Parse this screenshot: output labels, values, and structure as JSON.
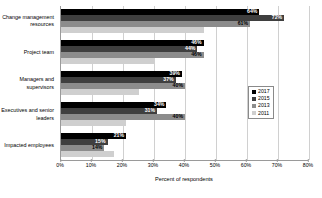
{
  "chart_data": {
    "type": "bar",
    "orientation": "horizontal",
    "title": "",
    "xlabel": "Percent of respondents",
    "ylabel": "",
    "xlim": [
      0,
      80
    ],
    "xticks": [
      "0%",
      "10%",
      "20%",
      "30%",
      "40%",
      "50%",
      "60%",
      "70%",
      "80%"
    ],
    "grid": true,
    "legend_position": "right",
    "categories": [
      "Change management resources",
      "Project team",
      "Managers and supervisors",
      "Executives and senior leaders",
      "Impacted employees"
    ],
    "series": [
      {
        "name": "2017",
        "color": "#000000",
        "values": [
          64,
          46,
          39,
          34,
          21
        ],
        "labels": [
          "64%",
          "46%",
          "39%",
          "34%",
          "21%"
        ]
      },
      {
        "name": "2015",
        "color": "#3f3f3f",
        "values": [
          72,
          44,
          37,
          31,
          15
        ],
        "labels": [
          "72%",
          "44%",
          "37%",
          "31%",
          "15%"
        ]
      },
      {
        "name": "2013",
        "color": "#8c8c8c",
        "values": [
          61,
          46,
          40,
          40,
          14
        ],
        "labels": [
          "61%",
          "46%",
          "40%",
          "40%",
          "14%"
        ]
      },
      {
        "name": "2011",
        "color": "#cfcfcf",
        "values": [
          46,
          30,
          25,
          21,
          17
        ],
        "labels": [
          "",
          "",
          "",
          "",
          ""
        ]
      }
    ]
  },
  "legend": {
    "items": [
      {
        "label": "2017",
        "color": "#000000"
      },
      {
        "label": "2015",
        "color": "#3f3f3f"
      },
      {
        "label": "2013",
        "color": "#8c8c8c"
      },
      {
        "label": "2011",
        "color": "#cfcfcf"
      }
    ]
  }
}
